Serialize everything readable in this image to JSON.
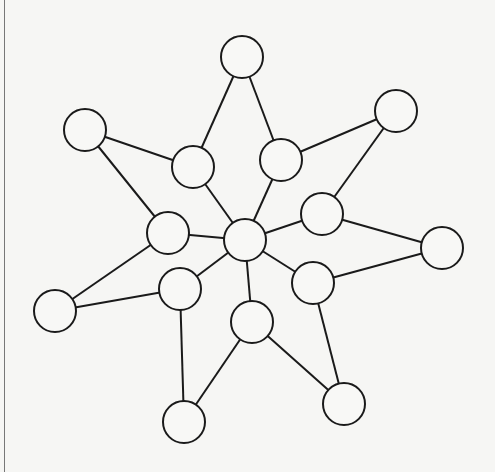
{
  "diagram": {
    "type": "undirected-graph",
    "stroke_color": "#1a1a1a",
    "node_fill": "#f8f8f6",
    "node_radius": 21,
    "nodes": [
      {
        "id": "top",
        "x": 242,
        "y": 57
      },
      {
        "id": "upper-left-outer",
        "x": 85,
        "y": 130
      },
      {
        "id": "left-inner-upper",
        "x": 193,
        "y": 167
      },
      {
        "id": "right-inner-upper",
        "x": 281,
        "y": 160
      },
      {
        "id": "upper-right-outer",
        "x": 396,
        "y": 111
      },
      {
        "id": "left-mid",
        "x": 168,
        "y": 233
      },
      {
        "id": "center",
        "x": 245,
        "y": 240
      },
      {
        "id": "right-mid",
        "x": 322,
        "y": 214
      },
      {
        "id": "far-right",
        "x": 442,
        "y": 248
      },
      {
        "id": "lower-left-outer",
        "x": 55,
        "y": 311
      },
      {
        "id": "left-lower-inner",
        "x": 180,
        "y": 289
      },
      {
        "id": "right-lower-inner",
        "x": 313,
        "y": 283
      },
      {
        "id": "bottom-center",
        "x": 252,
        "y": 322
      },
      {
        "id": "bottom-left",
        "x": 184,
        "y": 422
      },
      {
        "id": "bottom-right",
        "x": 344,
        "y": 404
      }
    ],
    "edges": [
      [
        "top",
        "left-inner-upper"
      ],
      [
        "top",
        "right-inner-upper"
      ],
      [
        "upper-left-outer",
        "left-inner-upper"
      ],
      [
        "upper-left-outer",
        "left-mid"
      ],
      [
        "left-inner-upper",
        "center"
      ],
      [
        "right-inner-upper",
        "center"
      ],
      [
        "right-inner-upper",
        "upper-right-outer"
      ],
      [
        "upper-right-outer",
        "right-mid"
      ],
      [
        "right-mid",
        "center"
      ],
      [
        "right-mid",
        "far-right"
      ],
      [
        "left-mid",
        "center"
      ],
      [
        "left-mid",
        "lower-left-outer"
      ],
      [
        "lower-left-outer",
        "left-lower-inner"
      ],
      [
        "left-lower-inner",
        "center"
      ],
      [
        "left-lower-inner",
        "bottom-left"
      ],
      [
        "center",
        "bottom-center"
      ],
      [
        "center",
        "right-lower-inner"
      ],
      [
        "right-lower-inner",
        "far-right"
      ],
      [
        "right-lower-inner",
        "bottom-right"
      ],
      [
        "bottom-center",
        "bottom-left"
      ],
      [
        "bottom-center",
        "bottom-right"
      ]
    ]
  }
}
